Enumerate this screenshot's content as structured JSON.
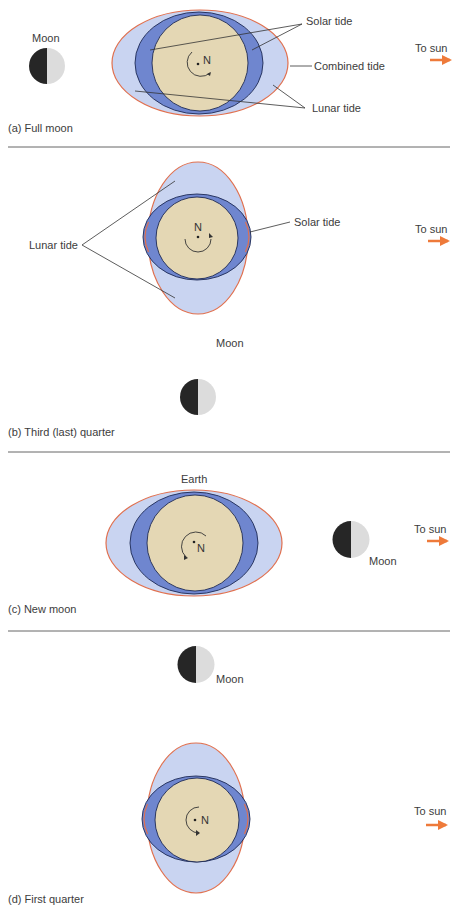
{
  "colors": {
    "earth": "#e4d7b4",
    "solar_tide": "#6f86cf",
    "lunar_tide": "#c9d4f1",
    "combined_outline": "#e0704f",
    "moon_dark": "#262626",
    "moon_light": "#dcdcdc",
    "arrow": "#ee7a3a",
    "leader": "#333333",
    "divider": "#555555"
  },
  "panels": [
    {
      "id": "a",
      "caption": "(a) Full moon",
      "moon_label": "Moon",
      "sun_label": "To sun",
      "callouts": {
        "solar_tide": "Solar tide",
        "combined_tide": "Combined tide",
        "lunar_tide": "Lunar tide"
      },
      "north_label": "N"
    },
    {
      "id": "b",
      "caption": "(b) Third (last) quarter",
      "moon_label": "Moon",
      "sun_label": "To sun",
      "callouts": {
        "lunar_tide": "Lunar tide",
        "solar_tide": "Solar tide"
      },
      "north_label": "N"
    },
    {
      "id": "c",
      "caption": "(c) New moon",
      "earth_label": "Earth",
      "moon_label": "Moon",
      "sun_label": "To sun",
      "north_label": "N"
    },
    {
      "id": "d",
      "caption": "(d) First quarter",
      "moon_label": "Moon",
      "sun_label": "To sun",
      "north_label": "N"
    }
  ]
}
